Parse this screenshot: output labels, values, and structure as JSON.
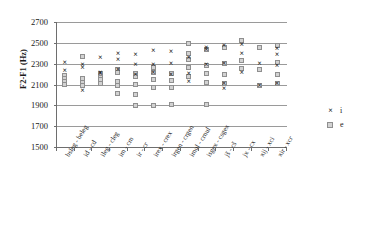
{
  "chart_data": {
    "type": "scatter",
    "title": "",
    "xlabel": "",
    "ylabel": "F2-F1 (Hz)",
    "ylim": [
      1500,
      2700
    ],
    "yticks": [
      1500,
      1700,
      1900,
      2100,
      2300,
      2500,
      2700
    ],
    "grid": true,
    "legend_position": "right",
    "categories": [
      "bsleg - beleg",
      "id - cd",
      "ileg - cleg",
      "im - cm",
      "ir - cr",
      "irex - crex",
      "irgen - crgen",
      "imul - crnul",
      "isgex - csgex",
      "jš - cš",
      "jx - cx",
      "xij - xci",
      "xir - xcr"
    ],
    "series": [
      {
        "name": "i",
        "marker": "x",
        "color": "#111111",
        "points": [
          [
            0,
            2310
          ],
          [
            0,
            2230
          ],
          [
            1,
            2285
          ],
          [
            1,
            2262
          ],
          [
            1,
            2040
          ],
          [
            2,
            2350
          ],
          [
            2,
            2215
          ],
          [
            2,
            2200
          ],
          [
            3,
            2395
          ],
          [
            3,
            2340
          ],
          [
            3,
            2238
          ],
          [
            4,
            2380
          ],
          [
            4,
            2290
          ],
          [
            4,
            2195
          ],
          [
            5,
            2420
          ],
          [
            5,
            2290
          ],
          [
            5,
            2210
          ],
          [
            6,
            2410
          ],
          [
            6,
            2300
          ],
          [
            6,
            2195
          ],
          [
            7,
            2355
          ],
          [
            7,
            2205
          ],
          [
            7,
            2120
          ],
          [
            8,
            2455
          ],
          [
            8,
            2430
          ],
          [
            8,
            2290
          ],
          [
            9,
            2470
          ],
          [
            9,
            2300
          ],
          [
            9,
            2105
          ],
          [
            9,
            2060
          ],
          [
            10,
            2480
          ],
          [
            10,
            2390
          ],
          [
            10,
            2215
          ],
          [
            11,
            2300
          ],
          [
            11,
            2090
          ],
          [
            12,
            2440
          ],
          [
            12,
            2380
          ],
          [
            12,
            2280
          ],
          [
            12,
            2105
          ]
        ]
      },
      {
        "name": "e",
        "marker": "square",
        "color": "#d2d2d2",
        "points": [
          [
            0,
            2190
          ],
          [
            0,
            2160
          ],
          [
            0,
            2130
          ],
          [
            0,
            2100
          ],
          [
            1,
            2365
          ],
          [
            1,
            2155
          ],
          [
            1,
            2120
          ],
          [
            1,
            2090
          ],
          [
            2,
            2205
          ],
          [
            2,
            2170
          ],
          [
            2,
            2145
          ],
          [
            2,
            2105
          ],
          [
            3,
            2245
          ],
          [
            3,
            2215
          ],
          [
            3,
            2130
          ],
          [
            3,
            2095
          ],
          [
            3,
            2015
          ],
          [
            4,
            2205
          ],
          [
            4,
            2175
          ],
          [
            4,
            2100
          ],
          [
            4,
            2000
          ],
          [
            4,
            1900
          ],
          [
            5,
            2260
          ],
          [
            5,
            2215
          ],
          [
            5,
            2150
          ],
          [
            5,
            2075
          ],
          [
            5,
            1900
          ],
          [
            6,
            2205
          ],
          [
            6,
            2135
          ],
          [
            6,
            2070
          ],
          [
            6,
            1905
          ],
          [
            7,
            2490
          ],
          [
            7,
            2400
          ],
          [
            7,
            2340
          ],
          [
            7,
            2260
          ],
          [
            7,
            2180
          ],
          [
            8,
            2440
          ],
          [
            8,
            2280
          ],
          [
            8,
            2210
          ],
          [
            8,
            2115
          ],
          [
            8,
            1905
          ],
          [
            9,
            2460
          ],
          [
            9,
            2300
          ],
          [
            9,
            2200
          ],
          [
            9,
            2110
          ],
          [
            10,
            2520
          ],
          [
            10,
            2330
          ],
          [
            10,
            2250
          ],
          [
            11,
            2455
          ],
          [
            11,
            2240
          ],
          [
            11,
            2090
          ],
          [
            12,
            2470
          ],
          [
            12,
            2310
          ],
          [
            12,
            2195
          ],
          [
            12,
            2110
          ]
        ]
      }
    ],
    "legend": [
      {
        "label": "i",
        "marker": "x"
      },
      {
        "label": "e",
        "marker": "square"
      }
    ]
  }
}
